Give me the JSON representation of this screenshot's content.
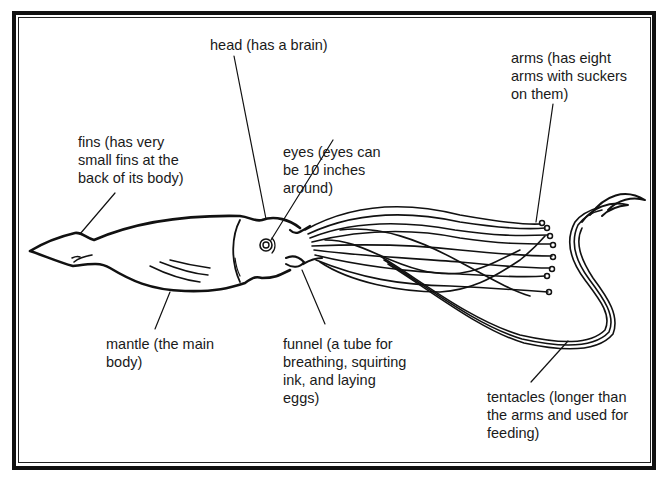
{
  "diagram": {
    "colors": {
      "ink": "#111111",
      "background": "#ffffff"
    },
    "labels": {
      "head": "head (has a brain)",
      "fins": "fins (has very\nsmall fins at the\nback of its body)",
      "eyes": "eyes (eyes can\nbe 10 inches\naround)",
      "arms": "arms (has eight\narms with suckers\non them)",
      "mantle": "mantle (the main\nbody)",
      "funnel": "funnel (a tube for\nbreathing, squirting\nink, and laying\neggs)",
      "tentacles": "tentacles (longer than\nthe arms and used for\nfeeding)"
    }
  }
}
